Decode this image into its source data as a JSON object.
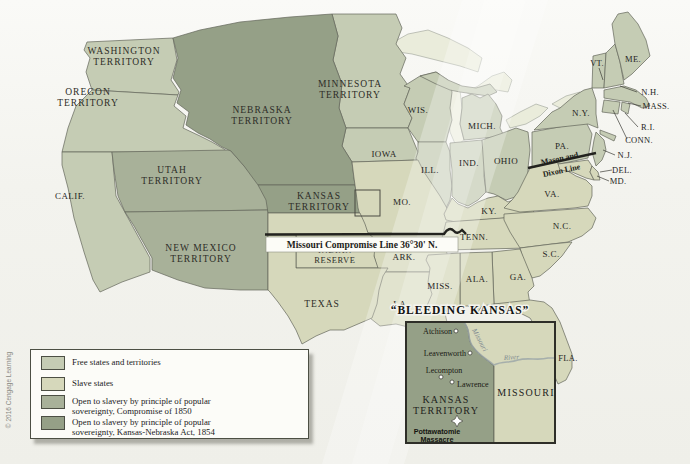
{
  "copyright": "© 2016 Cengage Learning",
  "colors": {
    "free": "#c5ccb4",
    "slave": "#d6d8bb",
    "comp1850": "#a8b199",
    "kn1854": "#95a087",
    "water": "#eaecdb",
    "legend_bg": "#fcfcf8"
  },
  "map": {
    "territories": {
      "washington": [
        "WASHINGTON",
        "TERRITORY"
      ],
      "oregon": [
        "OREGON",
        "TERRITORY"
      ],
      "nebraska": [
        "NEBRASKA",
        "TERRITORY"
      ],
      "utah": [
        "UTAH",
        "TERRITORY"
      ],
      "new_mexico": [
        "NEW MEXICO",
        "TERRITORY"
      ],
      "kansas": [
        "KANSAS",
        "TERRITORY"
      ],
      "minnesota": [
        "MINNESOTA",
        "TERRITORY"
      ],
      "indian_reserve": [
        "INDIAN",
        "RESERVE"
      ]
    },
    "states": {
      "calif": "CALIF.",
      "texas": "TEXAS",
      "iowa": "IOWA",
      "wis": "WIS.",
      "mich": "MICH.",
      "ill": "ILL.",
      "ind": "IND.",
      "ohio": "OHIO",
      "mo": "MO.",
      "ark": "ARK.",
      "la": "LA.",
      "miss": "MISS.",
      "ala": "ALA.",
      "ga": "GA.",
      "sc": "S.C.",
      "nc": "N.C.",
      "tenn": "TENN.",
      "ky": "KY.",
      "va": "VA.",
      "pa": "PA.",
      "ny": "N.Y.",
      "vt": "VT.",
      "me": "ME.",
      "nh": "N.H.",
      "mass": "MASS.",
      "ri": "R.I.",
      "conn": "CONN.",
      "nj": "N.J.",
      "del": "DEL.",
      "md": "MD.",
      "fla": "FLA."
    },
    "lines": {
      "mason_dixon": [
        "Mason and",
        "Dixon Line"
      ],
      "compromise": "Missouri Compromise Line 36°30' N."
    }
  },
  "inset": {
    "title": "“BLEEDING KANSAS”",
    "towns": [
      "Atchison",
      "Leavenworth",
      "Lecompton",
      "Lawrence"
    ],
    "region_labels": {
      "kansas": [
        "KANSAS",
        "TERRITORY"
      ],
      "missouri": "MISSOURI"
    },
    "event": [
      "Pottawatomie",
      "Massacre"
    ],
    "river": [
      "Missouri",
      "River"
    ]
  },
  "legend": {
    "items": [
      {
        "lines": [
          "Free states and territories"
        ]
      },
      {
        "lines": [
          "Slave states"
        ]
      },
      {
        "lines": [
          "Open to slavery by principle of popular",
          "sovereignty, Compromise of 1850"
        ]
      },
      {
        "lines": [
          "Open to slavery by principle of popular",
          "sovereignty, Kansas-Nebraska Act, 1854"
        ]
      }
    ]
  }
}
